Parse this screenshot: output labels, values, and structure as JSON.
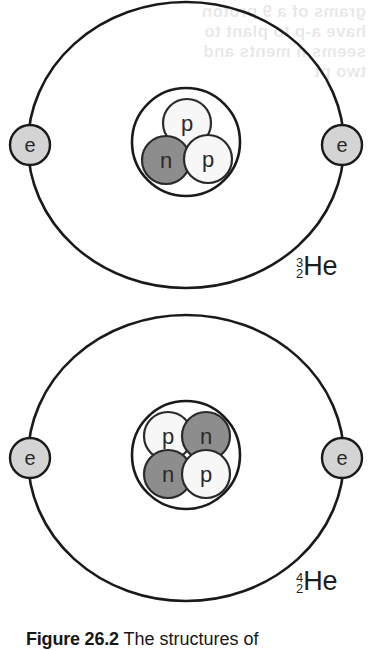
{
  "figure": {
    "caption_number": "Figure 26.2",
    "caption_text": " The structures of",
    "background_color": "#ffffff",
    "ink_color": "#1a1a1a"
  },
  "ghost_text": "grams of a 9 proton\nhave a-p  to plant to\nseems n  ments and\ntwo  pt",
  "palette": {
    "orbit_stroke": "#1a1a1a",
    "nucleus_stroke": "#1a1a1a",
    "proton_fill": "#f7f7f7",
    "proton_stroke": "#2a2a2a",
    "neutron_fill": "#8d8d8d",
    "neutron_stroke": "#2a2a2a",
    "electron_fill": "#d4d4d4",
    "electron_stroke": "#1a1a1a",
    "particle_label_color": "#2a2a2a"
  },
  "atoms": [
    {
      "id": "he3",
      "name": "helium-3",
      "mass_number": "3",
      "atomic_number": "2",
      "symbol": "He",
      "orbit": {
        "cx": 186,
        "cy": 145,
        "rx": 158,
        "ry": 143
      },
      "nucleus": {
        "cx": 186,
        "cy": 142,
        "r": 54
      },
      "electrons": [
        {
          "label": "e",
          "cx": 30,
          "cy": 145,
          "r": 20
        },
        {
          "label": "e",
          "cx": 342,
          "cy": 145,
          "r": 20
        }
      ],
      "nucleons": [
        {
          "label": "p",
          "type": "proton",
          "cx": 187,
          "cy": 123,
          "r": 24
        },
        {
          "label": "n",
          "type": "neutron",
          "cx": 166,
          "cy": 160,
          "r": 24
        },
        {
          "label": "p",
          "type": "proton",
          "cx": 208,
          "cy": 159,
          "r": 24
        }
      ]
    },
    {
      "id": "he4",
      "name": "helium-4",
      "mass_number": "4",
      "atomic_number": "2",
      "symbol": "He",
      "orbit": {
        "cx": 186,
        "cy": 458,
        "rx": 158,
        "ry": 143
      },
      "nucleus": {
        "cx": 186,
        "cy": 455,
        "r": 54
      },
      "electrons": [
        {
          "label": "e",
          "cx": 30,
          "cy": 458,
          "r": 20
        },
        {
          "label": "e",
          "cx": 342,
          "cy": 458,
          "r": 20
        }
      ],
      "nucleons": [
        {
          "label": "p",
          "type": "proton",
          "cx": 168,
          "cy": 436,
          "r": 24
        },
        {
          "label": "n",
          "type": "neutron",
          "cx": 206,
          "cy": 436,
          "r": 24
        },
        {
          "label": "n",
          "type": "neutron",
          "cx": 168,
          "cy": 474,
          "r": 24
        },
        {
          "label": "p",
          "type": "proton",
          "cx": 206,
          "cy": 474,
          "r": 24
        }
      ]
    }
  ]
}
